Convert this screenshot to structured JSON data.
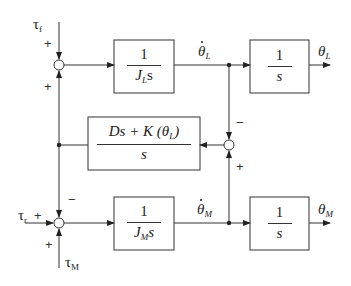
{
  "diagram": {
    "type": "block_diagram",
    "inputs": {
      "tau_f": {
        "symbol": "τ",
        "sub": "f"
      },
      "tau_r": {
        "symbol": "τ",
        "sub": "r"
      },
      "tau_M": {
        "symbol": "τ",
        "sub": "M"
      }
    },
    "outputs": {
      "theta_L_dot": {
        "symbol": "θ",
        "sub": "L",
        "dot": true
      },
      "theta_L": {
        "symbol": "θ",
        "sub": "L"
      },
      "theta_M_dot": {
        "symbol": "θ",
        "sub": "M",
        "dot": true
      },
      "theta_M": {
        "symbol": "θ",
        "sub": "M"
      }
    },
    "blocks": {
      "load_inertia": {
        "numerator": "1",
        "denominator_main": "J",
        "denominator_sub": "L",
        "denominator_tail": "s"
      },
      "load_integrator": {
        "numerator": "1",
        "denominator": "s"
      },
      "coupling": {
        "numerator": "Ds + K (θ",
        "numerator_sub": "L",
        "numerator_tail": ")",
        "denominator": "s"
      },
      "motor_inertia": {
        "numerator": "1",
        "denominator_main": "J",
        "denominator_sub": "M",
        "denominator_tail": "s"
      },
      "motor_integrator": {
        "numerator": "1",
        "denominator": "s"
      }
    },
    "junctions": {
      "top": {
        "signs": {
          "top": "+",
          "bottom": "+"
        }
      },
      "right": {
        "signs": {
          "top": "−",
          "bottom": "+"
        }
      },
      "bottom": {
        "signs": {
          "top": "−",
          "left": "+",
          "bottom": "+"
        }
      }
    }
  }
}
